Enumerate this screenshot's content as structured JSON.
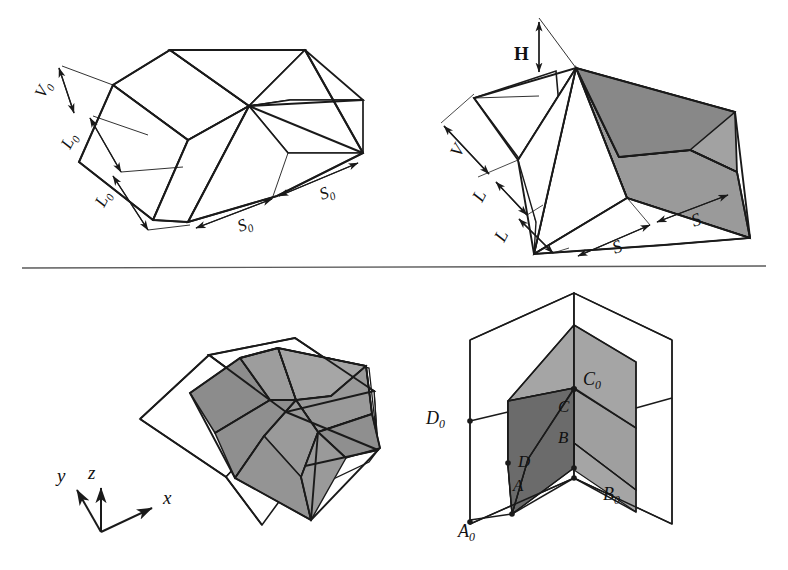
{
  "figure": {
    "title_visible": false,
    "background_color": "#ffffff",
    "line_color": "#1a1a1a",
    "divider": {
      "name": "horizontal-rule",
      "x1": 22,
      "y1": 268,
      "x2": 766,
      "y2": 266
    },
    "shading": {
      "light_gray": "#a8a8a8",
      "mid_gray": "#9a9a9a",
      "dark_gray": "#6f6f6f",
      "darker_gray": "#5c5c5c",
      "white": "#ffffff"
    },
    "panels": [
      {
        "id": "top-left",
        "name": "undeformed-reference-configuration",
        "labels": [
          {
            "id": "v0",
            "text": "V",
            "sub": "0",
            "x": 44,
            "y": 97,
            "rotate": -62,
            "style": "italic"
          },
          {
            "id": "l0a",
            "text": "L",
            "sub": "0",
            "x": 72,
            "y": 147,
            "rotate": -62,
            "style": "italic"
          },
          {
            "id": "l0b",
            "text": "L",
            "sub": "0",
            "x": 106,
            "y": 205,
            "rotate": -62,
            "style": "italic"
          },
          {
            "id": "s0a",
            "text": "S",
            "sub": "0",
            "x": 248,
            "y": 228,
            "rotate": -21,
            "style": "italic"
          },
          {
            "id": "s0b",
            "text": "S",
            "sub": "0",
            "x": 330,
            "y": 196,
            "rotate": -21,
            "style": "italic"
          }
        ]
      },
      {
        "id": "top-right",
        "name": "deformed-folded-configuration",
        "labels": [
          {
            "id": "h",
            "text": "H",
            "sub": "",
            "x": 524,
            "y": 56,
            "rotate": 0,
            "style": "upright"
          },
          {
            "id": "v",
            "text": "V",
            "sub": "",
            "x": 460,
            "y": 155,
            "rotate": -62,
            "style": "italic"
          },
          {
            "id": "la",
            "text": "L",
            "sub": "",
            "x": 484,
            "y": 200,
            "rotate": -62,
            "style": "italic"
          },
          {
            "id": "lb",
            "text": "L",
            "sub": "",
            "x": 506,
            "y": 240,
            "rotate": -62,
            "style": "italic"
          },
          {
            "id": "sa",
            "text": "S",
            "sub": "",
            "x": 622,
            "y": 250,
            "rotate": -21,
            "style": "italic"
          },
          {
            "id": "sb",
            "text": "S",
            "sub": "",
            "x": 700,
            "y": 223,
            "rotate": -21,
            "style": "italic"
          }
        ]
      },
      {
        "id": "bottom-left",
        "name": "three-dimensional-fold-assembly",
        "axes": {
          "name": "axis-triad",
          "origin": {
            "x": 101,
            "y": 532
          },
          "labels": [
            {
              "id": "axis-y",
              "text": "y",
              "x": 62,
              "y": 476
            },
            {
              "id": "axis-z",
              "text": "z",
              "x": 93,
              "y": 473
            },
            {
              "id": "axis-x",
              "text": "x",
              "x": 167,
              "y": 500
            }
          ]
        }
      },
      {
        "id": "bottom-right",
        "name": "corner-fold-vertex-labels",
        "labels": [
          {
            "id": "A0",
            "text": "A",
            "sub": "0",
            "x": 466,
            "y": 529
          },
          {
            "id": "B0",
            "text": "B",
            "sub": "0",
            "x": 640,
            "y": 494
          },
          {
            "id": "C0",
            "text": "C",
            "sub": "0",
            "x": 589,
            "y": 381
          },
          {
            "id": "D0",
            "text": "D",
            "sub": "0",
            "x": 431,
            "y": 421
          },
          {
            "id": "A",
            "text": "A",
            "sub": "",
            "x": 533,
            "y": 485
          },
          {
            "id": "B",
            "text": "B",
            "sub": "",
            "x": 567,
            "y": 441
          },
          {
            "id": "C",
            "text": "C",
            "sub": "",
            "x": 567,
            "y": 409
          },
          {
            "id": "D",
            "text": "D",
            "sub": "",
            "x": 527,
            "y": 463
          }
        ]
      }
    ]
  }
}
